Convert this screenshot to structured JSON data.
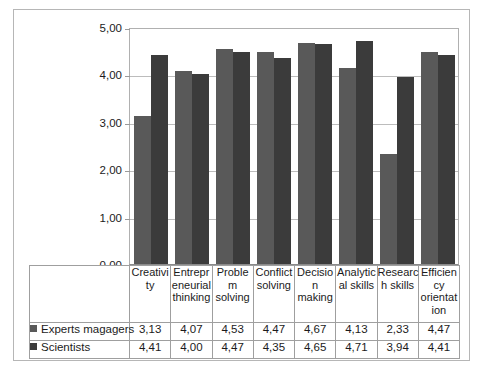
{
  "chart_data": {
    "type": "bar",
    "title": "",
    "subtitle": "",
    "xlabel": "",
    "ylabel": "",
    "ylim": [
      0,
      5
    ],
    "ytick_labels": [
      "5,00",
      "4,00",
      "3,00",
      "2,00",
      "1,00",
      "0,00"
    ],
    "ytick_values": [
      5,
      4,
      3,
      2,
      1,
      0
    ],
    "grid": true,
    "legend_position": "data-table-left",
    "decimal_separator": ",",
    "categories": [
      "Creativity",
      "Entrepreneurial thinking",
      "Problem solving",
      "Conflict solving",
      "Decision making",
      "Analytical skills",
      "Research skills",
      "Efficiency orientation"
    ],
    "category_label_lines": [
      [
        "Creativi",
        "ty"
      ],
      [
        "Entrepr",
        "eneurial",
        "thinking"
      ],
      [
        "Proble",
        "m",
        "solving"
      ],
      [
        "Conflict",
        "solving"
      ],
      [
        "Decisio",
        "n",
        "making"
      ],
      [
        "Analytic",
        "al skills"
      ],
      [
        "Researc",
        "h skills"
      ],
      [
        "Efficien",
        "cy",
        "orientat",
        "ion"
      ]
    ],
    "series": [
      {
        "name": "Experts magagers",
        "color": "#595959",
        "values": [
          3.13,
          4.07,
          4.53,
          4.47,
          4.67,
          4.13,
          2.33,
          4.47
        ],
        "labels": [
          "3,13",
          "4,07",
          "4,53",
          "4,47",
          "4,67",
          "4,13",
          "2,33",
          "4,47"
        ]
      },
      {
        "name": "Scientists",
        "color": "#3b3b3b",
        "values": [
          4.41,
          4.0,
          4.47,
          4.35,
          4.65,
          4.71,
          3.94,
          4.41
        ],
        "labels": [
          "4,41",
          "4,00",
          "4,47",
          "4,35",
          "4,65",
          "4,71",
          "3,94",
          "4,41"
        ]
      }
    ]
  },
  "colors": {
    "series_1": "#595959",
    "series_2": "#3b3b3b",
    "gridline": "#bcbcbc",
    "frame_border": "#b6b6b6",
    "table_border": "#9f9f9f",
    "background": "#ffffff",
    "text": "#1b1b1b"
  }
}
